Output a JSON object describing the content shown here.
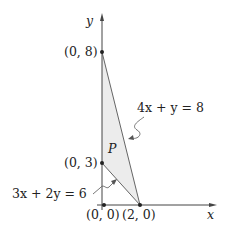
{
  "axes": {
    "x_label": "x",
    "y_label": "y"
  },
  "points": [
    {
      "label": "(0, 8)",
      "x": 0,
      "y": 8
    },
    {
      "label": "(0, 3)",
      "x": 0,
      "y": 3
    },
    {
      "label": "(0, 0)",
      "x": 0,
      "y": 0
    },
    {
      "label": "(2, 0)",
      "x": 2,
      "y": 0
    }
  ],
  "region": {
    "label": "P",
    "fill": "#ececec",
    "vertices": [
      "(0, 8)",
      "(0, 3)",
      "(2, 0)"
    ]
  },
  "lines": [
    {
      "equation": "4x + y = 8",
      "from": "(0, 8)",
      "to": "(2, 0)"
    },
    {
      "equation": "3x + 2y = 6",
      "from": "(0, 3)",
      "to": "(2, 0)"
    }
  ]
}
